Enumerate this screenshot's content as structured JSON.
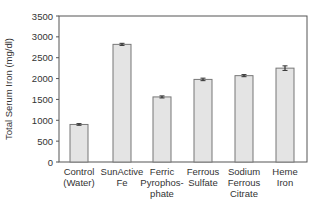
{
  "chart_data": {
    "type": "bar",
    "title": "",
    "xlabel": "",
    "ylabel": "Total Serum Iron (mg/dl)",
    "ylim": [
      0,
      3500
    ],
    "yticks": [
      0,
      500,
      1000,
      1500,
      2000,
      2500,
      3000,
      3500
    ],
    "grid": false,
    "legend": null,
    "categories": [
      [
        "Control",
        "(Water)"
      ],
      [
        "SunActive",
        "Fe"
      ],
      [
        "Ferric",
        "Pyrophos-",
        "phate"
      ],
      [
        "Ferrous",
        "Sulfate"
      ],
      [
        "Sodium",
        "Ferrous",
        "Citrate"
      ],
      [
        "Heme",
        "Iron"
      ]
    ],
    "values": [
      900,
      2820,
      1560,
      1980,
      2070,
      2250
    ],
    "errors": [
      20,
      25,
      25,
      30,
      25,
      55
    ],
    "bar_color": "#e4e4e4",
    "bar_edge": "#777777"
  }
}
